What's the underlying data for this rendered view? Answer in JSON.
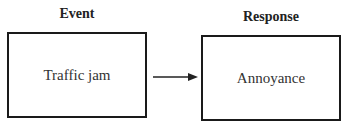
{
  "diagram": {
    "event": {
      "heading": "Event",
      "text": "Traffic jam"
    },
    "response": {
      "heading": "Response",
      "text": "Annoyance"
    },
    "arrow": {
      "from": "event",
      "to": "response"
    }
  }
}
